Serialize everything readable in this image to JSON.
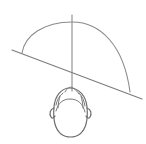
{
  "document": {
    "kind": "line-drawing",
    "title": "Head with dome arc and horizon line",
    "width": 146,
    "height": 144,
    "background_color": "#ffffff",
    "alt_text": "Simple grayscale line sketch: a semicircular dome arc with a vertical center axis, crossed by a diagonal horizon line, above a head drawn from above and behind showing hair and ears."
  },
  "palette": {
    "background": "#ffffff",
    "dome_stroke": "#8a8a8a",
    "axis_stroke": "#8a8a8a",
    "horizon_stroke": "#7d7d7d",
    "head_stroke": "#6e6e6e",
    "hair_stroke": "#7a7a7a"
  },
  "strokes": {
    "dome_width": 1.1,
    "axis_width": 1.1,
    "horizon_width": 1.2,
    "head_width": 1.2,
    "hair_width": 1.0
  },
  "geometry": {
    "dome": {
      "label": "dome-arc",
      "start": [
        22,
        53
      ],
      "apex": [
        72,
        22
      ],
      "end": [
        130,
        92
      ],
      "path": "M 22 53 C 25 35 44 22 72 22 C 101 22 124 46 130 92"
    },
    "vertical_axis": {
      "label": "vertical-axis-line",
      "start": [
        72,
        15
      ],
      "end": [
        72,
        91
      ],
      "path": "M 72 15 L 72 91"
    },
    "horizon": {
      "label": "diagonal-horizon-line",
      "start": [
        12,
        50
      ],
      "end": [
        142,
        99
      ],
      "path": "M 12 50 L 142 99"
    },
    "head_outline": {
      "label": "head-outline",
      "bounds": [
        53,
        88,
        88,
        138
      ],
      "path": "M 70 88 C 61 88 55 96 54 107 C 53 118 55 129 61 134 C 66 138 75 138 80 134 C 86 129 88 118 87 107 C 86 96 79 88 70 88 Z"
    },
    "hair_tuft": {
      "label": "hair-tuft",
      "path": "M 65 92 C 67 88 70 86 73 88 C 76 90 78 92 79 94"
    },
    "hairline": {
      "label": "hairline-arch",
      "path": "M 56 111 C 58 103 63 99 70 99 C 78 99 83 104 85 112"
    },
    "hair_left_wisp": {
      "label": "hair-wisp-left",
      "path": "M 56 105 C 57 100 59 96 63 93"
    },
    "hair_right_wisp": {
      "label": "hair-wisp-right",
      "path": "M 85 106 C 84 100 82 96 79 93"
    },
    "ear_left": {
      "label": "ear-left",
      "path": "M 54 108 C 50 109 49 114 51 117 C 52 119 54 118 55 116"
    },
    "ear_right": {
      "label": "ear-right",
      "path": "M 87 108 C 91 109 92 114 90 117 C 89 119 87 118 86 116"
    },
    "hair_part_left": {
      "label": "hair-part-left",
      "path": "M 60 96 C 59 100 58 104 58 108"
    },
    "hair_part_right": {
      "label": "hair-part-right",
      "path": "M 81 96 C 82 100 83 104 83 108"
    }
  }
}
